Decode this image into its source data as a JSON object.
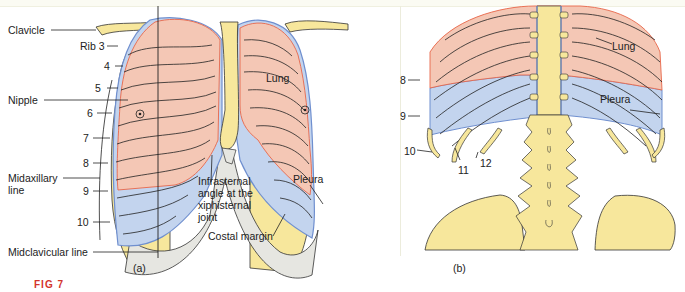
{
  "panel_a": {
    "caption": "(a)",
    "labels": {
      "clavicle": "Clavicle",
      "rib3": "Rib 3",
      "rib4": "4",
      "rib5": "5",
      "nipple": "Nipple",
      "rib6": "6",
      "rib7": "7",
      "rib8": "8",
      "midaxillary_1": "Midaxillary",
      "midaxillary_2": "line",
      "rib9": "9",
      "rib10": "10",
      "midclavicular": "Midclavicular line",
      "lung": "Lung",
      "pleura": "Pleura",
      "infrasternal_1": "Infrasternal",
      "infrasternal_2": "angle at the",
      "infrasternal_3": "xiphisternal",
      "infrasternal_4": "joint",
      "costal_margin": "Costal margin"
    }
  },
  "panel_b": {
    "caption": "(b)",
    "labels": {
      "lung": "Lung",
      "pleura": "Pleura",
      "rib8": "8",
      "rib9": "9",
      "rib10": "10",
      "rib11": "11",
      "rib12": "12"
    }
  },
  "colors": {
    "lung": "#f4c7b5",
    "pleura": "#c3d4ee",
    "bone": "#f7e79c",
    "cartilage": "#e6e6e1",
    "lung_edge": "#e8664a",
    "pleura_edge": "#6f8fcf"
  },
  "figure_label": "FIG 7"
}
